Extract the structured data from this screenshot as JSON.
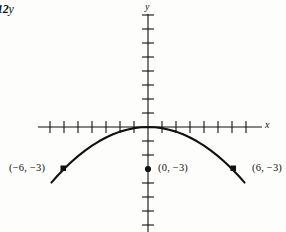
{
  "figure": {
    "number_label": "12",
    "number_suffix": "y",
    "background_color": "#fdfdfb",
    "ink_color": "#111111"
  },
  "axes": {
    "x_label": "x",
    "y_label": "y",
    "origin_px": {
      "x": 148,
      "y": 127
    },
    "tick_spacing_px": 14,
    "x_ticks_left": 7,
    "x_ticks_right": 7,
    "y_ticks_up": 8,
    "y_ticks_down": 7,
    "x_axis_start_px": 38,
    "x_axis_end_px": 262,
    "y_axis_start_px": 14,
    "y_axis_end_px": 232
  },
  "labels": {
    "left_point": "(−6, −3)",
    "vertex_point": "(0, −3)",
    "right_point": "(6, −3)"
  },
  "chart_data": {
    "type": "line",
    "title": "",
    "xlabel": "x",
    "ylabel": "y",
    "grid": false,
    "legend": null,
    "curve": {
      "name": "downward parabola",
      "equation": "y = -x^2/12",
      "vertex": [
        0,
        0
      ],
      "opens": "down",
      "x": [
        -6.9,
        -6.5,
        -6,
        -5.5,
        -5,
        -4.5,
        -4,
        -3.5,
        -3,
        -2.5,
        -2,
        -1.5,
        -1,
        -0.5,
        0,
        0.5,
        1,
        1.5,
        2,
        2.5,
        3,
        3.5,
        4,
        4.5,
        5,
        5.5,
        6,
        6.5,
        6.9
      ],
      "y": [
        -3.97,
        -3.52,
        -3.0,
        -2.52,
        -2.08,
        -1.69,
        -1.33,
        -1.02,
        -0.75,
        -0.52,
        -0.33,
        -0.19,
        -0.08,
        -0.02,
        0,
        -0.02,
        -0.08,
        -0.19,
        -0.33,
        -0.52,
        -0.75,
        -1.02,
        -1.33,
        -1.69,
        -2.08,
        -2.52,
        -3.0,
        -3.52,
        -3.97
      ]
    },
    "marked_points": [
      {
        "label": "(−6, −3)",
        "x": -6,
        "y": -3,
        "marker": "square"
      },
      {
        "label": "(0, −3)",
        "x": 0,
        "y": -3,
        "marker": "circle"
      },
      {
        "label": "(6, −3)",
        "x": 6,
        "y": -3,
        "marker": "square"
      }
    ],
    "xlim": [
      -8,
      8.2
    ],
    "ylim": [
      -7.5,
      8.2
    ]
  }
}
